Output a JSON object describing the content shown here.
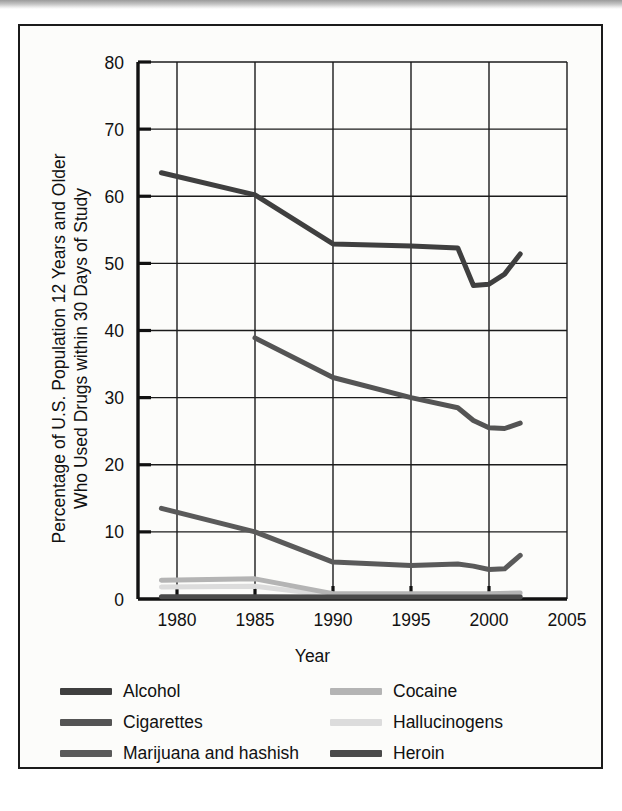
{
  "figure": {
    "background_color": "#fcfcfa",
    "frame_color": "#1b1b1b"
  },
  "chart_data": {
    "type": "line",
    "title": "",
    "xlabel": "Year",
    "ylabel": "Percentage of U.S. Population 12 Years and Older\nWho Used Drugs within 30 Days of Study",
    "xlim": [
      1977.5,
      2005
    ],
    "ylim": [
      0,
      80
    ],
    "xticks": [
      1980,
      1985,
      1990,
      1995,
      2000,
      2005
    ],
    "xtick_labels": [
      "1980",
      "1985",
      "1990",
      "1995",
      "2000",
      "2005"
    ],
    "yticks": [
      0,
      10,
      20,
      30,
      40,
      50,
      60,
      70,
      80
    ],
    "ytick_labels": [
      "0",
      "10",
      "20",
      "30",
      "40",
      "50",
      "60",
      "70",
      "80"
    ],
    "grid": true,
    "grid_color": "#1b1b1b",
    "legend_position": "below-axes",
    "legend_columns": 2,
    "series": [
      {
        "name": "Alcohol",
        "color": "#3f3f3f",
        "width": 5.0,
        "x": [
          1979,
          1985,
          1990,
          1995,
          1998,
          1999,
          2000,
          2001,
          2002
        ],
        "y": [
          63.5,
          60.2,
          52.9,
          52.6,
          52.3,
          46.7,
          46.9,
          48.4,
          51.4
        ]
      },
      {
        "name": "Cigarettes",
        "color": "#545454",
        "width": 5.0,
        "x": [
          1985,
          1990,
          1995,
          1998,
          1999,
          2000,
          2001,
          2002
        ],
        "y": [
          38.9,
          33.0,
          30.0,
          28.5,
          26.6,
          25.5,
          25.4,
          26.2
        ]
      },
      {
        "name": "Marijuana and hashish",
        "color": "#5a5a5a",
        "width": 5.0,
        "x": [
          1979,
          1985,
          1990,
          1995,
          1998,
          1999,
          2000,
          2001,
          2002
        ],
        "y": [
          13.5,
          10.0,
          5.5,
          5.0,
          5.2,
          4.9,
          4.4,
          4.5,
          6.5
        ]
      },
      {
        "name": "Cocaine",
        "color": "#b4b4b4",
        "width": 5.0,
        "x": [
          1979,
          1985,
          1990,
          1995,
          2000,
          2002
        ],
        "y": [
          2.8,
          3.0,
          0.8,
          0.8,
          0.8,
          0.9
        ]
      },
      {
        "name": "Hallucinogens",
        "color": "#dcdcdc",
        "width": 5.0,
        "x": [
          1979,
          1985,
          1990,
          1995,
          2000,
          2002
        ],
        "y": [
          1.8,
          1.9,
          0.5,
          0.4,
          0.5,
          0.5
        ]
      },
      {
        "name": "Heroin",
        "color": "#4a4a4a",
        "width": 5.0,
        "x": [
          1979,
          1985,
          1990,
          1995,
          2000,
          2002
        ],
        "y": [
          0.35,
          0.35,
          0.3,
          0.3,
          0.3,
          0.3
        ]
      }
    ]
  },
  "legend": {
    "entries": [
      {
        "label": "Alcohol",
        "color": "#3f3f3f"
      },
      {
        "label": "Cocaine",
        "color": "#b4b4b4"
      },
      {
        "label": "Cigarettes",
        "color": "#545454"
      },
      {
        "label": "Hallucinogens",
        "color": "#dcdcdc"
      },
      {
        "label": "Marijuana and hashish",
        "color": "#5a5a5a"
      },
      {
        "label": "Heroin",
        "color": "#4a4a4a"
      }
    ]
  }
}
